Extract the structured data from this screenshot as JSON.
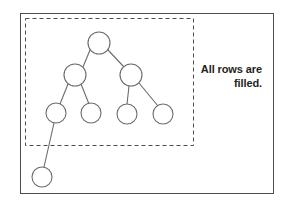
{
  "figure": {
    "name": "complete-binary-tree-diagram",
    "caption": {
      "line1": "All rows are",
      "line2": "filled."
    },
    "colors": {
      "frame_stroke": "#4d4d4d",
      "dashed_stroke": "#4d4d4d",
      "node_stroke": "#6b6b6b",
      "edge_stroke": "#6b6b6b",
      "node_fill": "#ffffff",
      "background": "#ffffff",
      "caption_text": "#231f20"
    },
    "frame": {
      "x": 20,
      "y": 13,
      "width": 253,
      "height": 180
    },
    "highlight_region": {
      "label": "dashed-selection-box",
      "x": 25,
      "y": 18,
      "width": 168,
      "height": 127,
      "dash": "4 3"
    },
    "nodes": [
      {
        "id": "root",
        "label": "tree-node-root",
        "cx": 99,
        "cy": 43,
        "r": 11,
        "level": 1,
        "inside_box": true
      },
      {
        "id": "n2",
        "label": "tree-node-level2-left",
        "cx": 75,
        "cy": 75,
        "r": 11,
        "level": 2,
        "inside_box": true
      },
      {
        "id": "n3",
        "label": "tree-node-level2-right",
        "cx": 131,
        "cy": 75,
        "r": 11,
        "level": 2,
        "inside_box": true
      },
      {
        "id": "n4",
        "label": "tree-node-level3-1",
        "cx": 56,
        "cy": 113,
        "r": 10,
        "level": 3,
        "inside_box": true
      },
      {
        "id": "n5",
        "label": "tree-node-level3-2",
        "cx": 91,
        "cy": 113,
        "r": 10,
        "level": 3,
        "inside_box": true
      },
      {
        "id": "n6",
        "label": "tree-node-level3-3",
        "cx": 127,
        "cy": 114,
        "r": 10,
        "level": 3,
        "inside_box": true
      },
      {
        "id": "n7",
        "label": "tree-node-level3-4",
        "cx": 163,
        "cy": 114,
        "r": 10,
        "level": 3,
        "inside_box": true
      },
      {
        "id": "n8",
        "label": "tree-node-level4-1",
        "cx": 42,
        "cy": 177,
        "r": 10,
        "level": 4,
        "inside_box": false
      }
    ],
    "edges": [
      {
        "label": "edge-root-to-level2-left",
        "x1": 90,
        "y1": 50,
        "x2": 83,
        "y2": 67
      },
      {
        "label": "edge-root-to-level2-right",
        "x1": 108,
        "y1": 50,
        "x2": 124,
        "y2": 67
      },
      {
        "label": "edge-n2-to-n4",
        "x1": 68,
        "y1": 84,
        "x2": 60,
        "y2": 104
      },
      {
        "label": "edge-n2-to-n5",
        "x1": 81,
        "y1": 84,
        "x2": 89,
        "y2": 104
      },
      {
        "label": "edge-n3-to-n6",
        "x1": 129,
        "y1": 86,
        "x2": 127,
        "y2": 104
      },
      {
        "label": "edge-n3-to-n7",
        "x1": 139,
        "y1": 83,
        "x2": 158,
        "y2": 106
      },
      {
        "label": "edge-n4-to-n8",
        "x1": 54,
        "y1": 123,
        "x2": 44,
        "y2": 167
      }
    ]
  }
}
